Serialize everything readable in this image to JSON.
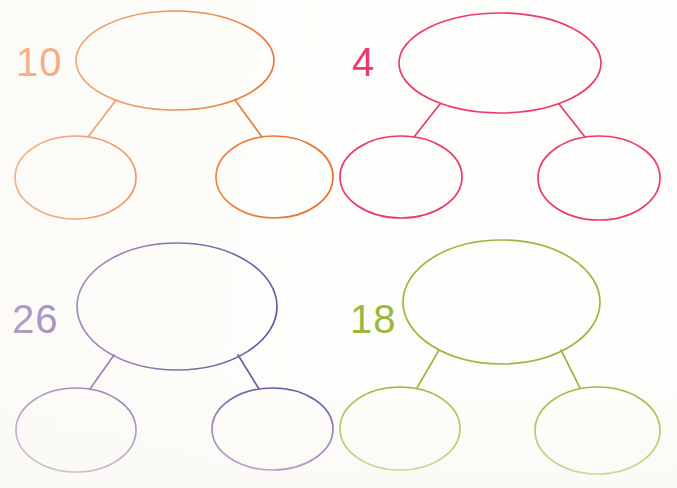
{
  "worksheet": {
    "type": "number-bond-worksheet",
    "background_color": "#fdfdfb",
    "width": 677,
    "height": 488,
    "groups": [
      {
        "id": "group-10",
        "label": "10",
        "color": "#e8702a",
        "position": "top-left",
        "label_x": 16,
        "label_y": 76,
        "parent": {
          "cx": 175,
          "cy": 60.5,
          "rx": 99,
          "ry": 49.5
        },
        "children": [
          {
            "cx": 75.5,
            "cy": 177.5,
            "rx": 60.5,
            "ry": 41.5
          },
          {
            "cx": 274.5,
            "cy": 177,
            "rx": 58.5,
            "ry": 41
          }
        ],
        "connectors": [
          {
            "x1": 116,
            "y1": 100,
            "x2": 88,
            "y2": 137
          },
          {
            "x1": 235,
            "y1": 100,
            "x2": 262,
            "y2": 137
          }
        ]
      },
      {
        "id": "group-4",
        "label": "4",
        "color": "#ec3a6c",
        "position": "top-right",
        "label_x": 352,
        "label_y": 76,
        "parent": {
          "cx": 500,
          "cy": 63,
          "rx": 101,
          "ry": 50
        },
        "children": [
          {
            "cx": 401,
            "cy": 177,
            "rx": 61,
            "ry": 41
          },
          {
            "cx": 599,
            "cy": 178,
            "rx": 61,
            "ry": 42
          }
        ],
        "connectors": [
          {
            "x1": 440,
            "y1": 104,
            "x2": 414,
            "y2": 137
          },
          {
            "x1": 559,
            "y1": 104,
            "x2": 585,
            "y2": 137
          }
        ]
      },
      {
        "id": "group-26",
        "label": "26",
        "color": "#6a4f9c",
        "position": "bottom-left",
        "label_x": 12,
        "label_y": 333,
        "parent": {
          "cx": 177,
          "cy": 306.5,
          "rx": 100,
          "ry": 63.5
        },
        "children": [
          {
            "cx": 76,
            "cy": 430,
            "rx": 60,
            "ry": 42
          },
          {
            "cx": 272.5,
            "cy": 429,
            "rx": 60.5,
            "ry": 41
          }
        ],
        "connectors": [
          {
            "x1": 114,
            "y1": 355,
            "x2": 90,
            "y2": 389
          },
          {
            "x1": 238,
            "y1": 355,
            "x2": 259,
            "y2": 389
          }
        ]
      },
      {
        "id": "group-18",
        "label": "18",
        "color": "#9cb83c",
        "position": "bottom-right",
        "label_x": 350,
        "label_y": 333,
        "parent": {
          "cx": 501.5,
          "cy": 302,
          "rx": 98.5,
          "ry": 62
        },
        "children": [
          {
            "cx": 400,
            "cy": 428.5,
            "rx": 60,
            "ry": 41.5
          },
          {
            "cx": 597.5,
            "cy": 430.5,
            "rx": 62.5,
            "ry": 43.5
          }
        ],
        "connectors": [
          {
            "x1": 439,
            "y1": 350,
            "x2": 417,
            "y2": 388
          },
          {
            "x1": 561,
            "y1": 350,
            "x2": 580,
            "y2": 388
          }
        ]
      }
    ]
  }
}
